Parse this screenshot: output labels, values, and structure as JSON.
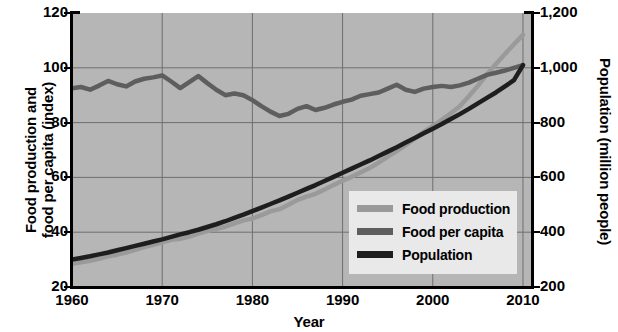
{
  "chart_data": {
    "type": "line",
    "title": "",
    "xlabel": "Year",
    "ylabel": "Food production and food per capita (index)",
    "ylabel_line1": "Food production and",
    "ylabel_line2": "food per capita (index)",
    "y2label": "Population (million people)",
    "xlim": [
      1960,
      2011
    ],
    "ylim": [
      20,
      120
    ],
    "y2lim": [
      200,
      1200
    ],
    "grid": true,
    "legend_position": "lower-right",
    "xticks": [
      "1960",
      "1970",
      "1980",
      "1990",
      "2000",
      "2010"
    ],
    "xtick_values": [
      1960,
      1970,
      1980,
      1990,
      2000,
      2010
    ],
    "yticks": [
      "20",
      "40",
      "60",
      "80",
      "100",
      "120"
    ],
    "ytick_values": [
      20,
      40,
      60,
      80,
      100,
      120
    ],
    "y2ticks": [
      "200",
      "400",
      "600",
      "800",
      "1,000",
      "1,200"
    ],
    "y2tick_values": [
      200,
      400,
      600,
      800,
      1000,
      1200
    ],
    "colors": {
      "food_production": "#9a9a9a",
      "food_per_capita": "#5e5e5e",
      "population": "#1e1e1e",
      "plot_background": "#b6b6b6",
      "gridline": "#6f6f6f",
      "legend_background": "#e9e9e9",
      "axis": "#000000"
    },
    "x": [
      1960,
      1961,
      1962,
      1963,
      1964,
      1965,
      1966,
      1967,
      1968,
      1969,
      1970,
      1971,
      1972,
      1973,
      1974,
      1975,
      1976,
      1977,
      1978,
      1979,
      1980,
      1981,
      1982,
      1983,
      1984,
      1985,
      1986,
      1987,
      1988,
      1989,
      1990,
      1991,
      1992,
      1993,
      1994,
      1995,
      1996,
      1997,
      1998,
      1999,
      2000,
      2001,
      2002,
      2003,
      2004,
      2005,
      2006,
      2007,
      2008,
      2009,
      2010
    ],
    "series": [
      {
        "name": "Food production",
        "axis": "left",
        "color": "#9a9a9a",
        "values": [
          28.5,
          29.0,
          29.6,
          30.3,
          31.2,
          31.8,
          32.6,
          33.6,
          34.6,
          35.4,
          36.3,
          37.2,
          37.6,
          38.4,
          39.5,
          40.4,
          41.2,
          42.0,
          43.2,
          44.3,
          45.0,
          46.2,
          47.6,
          48.4,
          50.0,
          51.8,
          53.0,
          54.0,
          55.6,
          57.2,
          58.8,
          60.2,
          61.8,
          63.4,
          65.4,
          67.6,
          69.6,
          71.8,
          74.2,
          76.6,
          78.8,
          81.0,
          83.4,
          86.0,
          89.6,
          93.4,
          97.6,
          101.4,
          105.0,
          108.6,
          112.0
        ]
      },
      {
        "name": "Food per capita",
        "axis": "left",
        "color": "#5e5e5e",
        "values": [
          92.5,
          93.0,
          92.0,
          93.5,
          95.2,
          94.0,
          93.2,
          95.0,
          96.0,
          96.5,
          97.2,
          95.0,
          92.6,
          94.8,
          97.0,
          94.4,
          92.0,
          90.0,
          90.6,
          90.0,
          88.2,
          86.0,
          84.0,
          82.4,
          83.2,
          85.0,
          86.0,
          84.6,
          85.4,
          86.6,
          87.6,
          88.4,
          89.8,
          90.4,
          91.0,
          92.4,
          93.8,
          92.0,
          91.2,
          92.4,
          93.0,
          93.4,
          93.0,
          93.6,
          94.6,
          96.0,
          97.4,
          98.2,
          99.0,
          100.0,
          101.0
        ]
      },
      {
        "name": "Population",
        "axis": "right",
        "color": "#1e1e1e",
        "values": [
          300,
          306,
          312,
          319,
          326,
          334,
          342,
          350,
          358,
          366,
          374,
          383,
          392,
          400,
          409,
          419,
          429,
          440,
          452,
          464,
          477,
          490,
          503,
          516,
          530,
          544,
          558,
          572,
          587,
          602,
          617,
          632,
          647,
          662,
          678,
          694,
          710,
          727,
          744,
          761,
          778,
          795,
          813,
          831,
          850,
          870,
          890,
          910,
          932,
          955,
          1010
        ]
      }
    ]
  },
  "legend": {
    "items": [
      {
        "label": "Food production",
        "color": "#9a9a9a"
      },
      {
        "label": "Food per capita",
        "color": "#5e5e5e"
      },
      {
        "label": "Population",
        "color": "#1e1e1e"
      }
    ]
  }
}
